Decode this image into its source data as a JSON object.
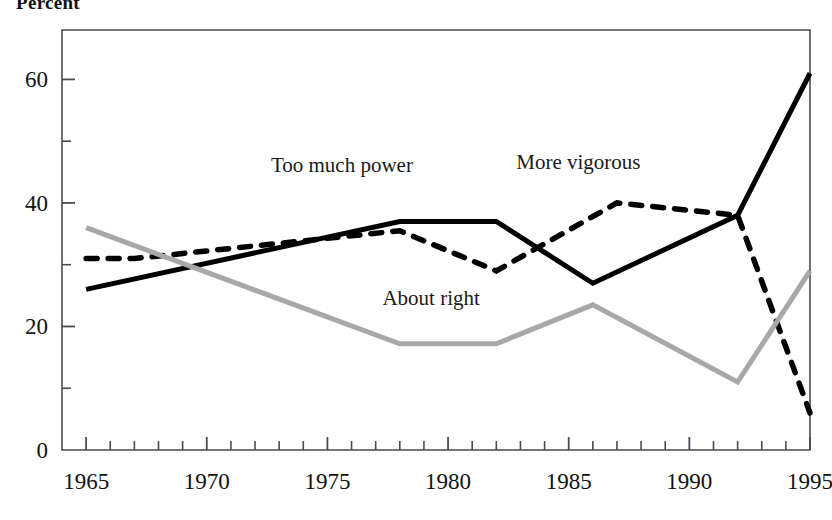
{
  "axis_title": "Percent",
  "chart_data": {
    "type": "line",
    "title": "Percent",
    "xlabel": "",
    "ylabel": "Percent",
    "xlim": [
      1964,
      1995
    ],
    "ylim": [
      0,
      68
    ],
    "yticks": [
      0,
      20,
      40,
      60
    ],
    "yticks_minor": [
      10,
      30,
      50
    ],
    "xticks": [
      1965,
      1970,
      1975,
      1980,
      1985,
      1990,
      1995
    ],
    "xticks_minor_every": 1,
    "grid": false,
    "legend": "inline-labels",
    "series": [
      {
        "name": "Too much power",
        "style": "solid",
        "color": "#000000",
        "label_x": 1975.6,
        "label_y": 45.0,
        "x": [
          1965,
          1978,
          1982,
          1986,
          1992,
          1995
        ],
        "values": [
          26,
          37,
          37,
          27,
          38,
          61
        ]
      },
      {
        "name": "More vigorous",
        "style": "dashed",
        "color": "#000000",
        "label_x": 1985.4,
        "label_y": 45.5,
        "x": [
          1965,
          1967,
          1978,
          1982,
          1987,
          1992,
          1995
        ],
        "values": [
          31,
          31,
          35.5,
          29,
          40,
          38,
          6
        ]
      },
      {
        "name": "About right",
        "style": "solid",
        "color": "#a8a8a8",
        "label_x": 1979.3,
        "label_y": 23.5,
        "x": [
          1965,
          1978,
          1982,
          1986,
          1992,
          1995
        ],
        "values": [
          36,
          17.2,
          17.2,
          23.5,
          11,
          29
        ]
      }
    ]
  },
  "y_tick_labels": [
    "0",
    "20",
    "40",
    "60"
  ],
  "x_tick_labels": [
    "1965",
    "1970",
    "1975",
    "1980",
    "1985",
    "1990",
    "1995"
  ],
  "series_labels": {
    "too_much_power": "Too much power",
    "more_vigorous": "More vigorous",
    "about_right": "About right"
  },
  "colors": {
    "solid_line": "#000000",
    "dashed_line": "#000000",
    "gray_line": "#a8a8a8",
    "axis": "#4a4a52",
    "text": "#111111"
  }
}
